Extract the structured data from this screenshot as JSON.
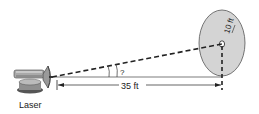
{
  "diagram": {
    "laser_label": "Laser",
    "distance_label": "35 ft",
    "radius_label": "10 ft",
    "angle_label": "?",
    "colors": {
      "target_fill": "#d4d4d4",
      "line": "#222222",
      "laser_body": "#9a9a9a"
    }
  }
}
